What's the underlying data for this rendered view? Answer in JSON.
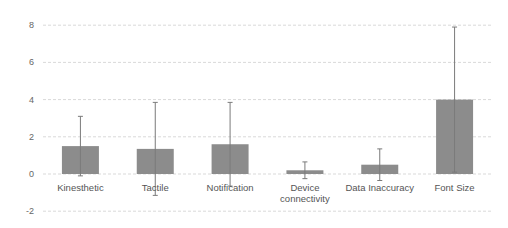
{
  "chart_data": {
    "type": "bar",
    "title": "",
    "xlabel": "",
    "ylabel": "",
    "ylim": [
      -2,
      8
    ],
    "yticks": [
      -2,
      0,
      2,
      4,
      6,
      8
    ],
    "grid": true,
    "legend": null,
    "categories": [
      "Kinesthetic",
      "Tactile",
      "Notification",
      "Device connectivity",
      "Data Inaccuracy",
      "Font Size"
    ],
    "category_lines": [
      [
        "Kinesthetic"
      ],
      [
        "Tactile"
      ],
      [
        "Notification"
      ],
      [
        "Device",
        "connectivity"
      ],
      [
        "Data Inaccuracy"
      ],
      [
        "Font Size"
      ]
    ],
    "values": [
      1.5,
      1.35,
      1.6,
      0.2,
      0.5,
      4.0
    ],
    "error": [
      1.6,
      2.5,
      2.25,
      0.45,
      0.85,
      3.9
    ],
    "colors": {
      "bar": "#8c8c8c",
      "error_bar": "#7a7a7a",
      "grid": "#d9d9d9",
      "tick_text": "#666666",
      "category_text": "#555555"
    }
  }
}
